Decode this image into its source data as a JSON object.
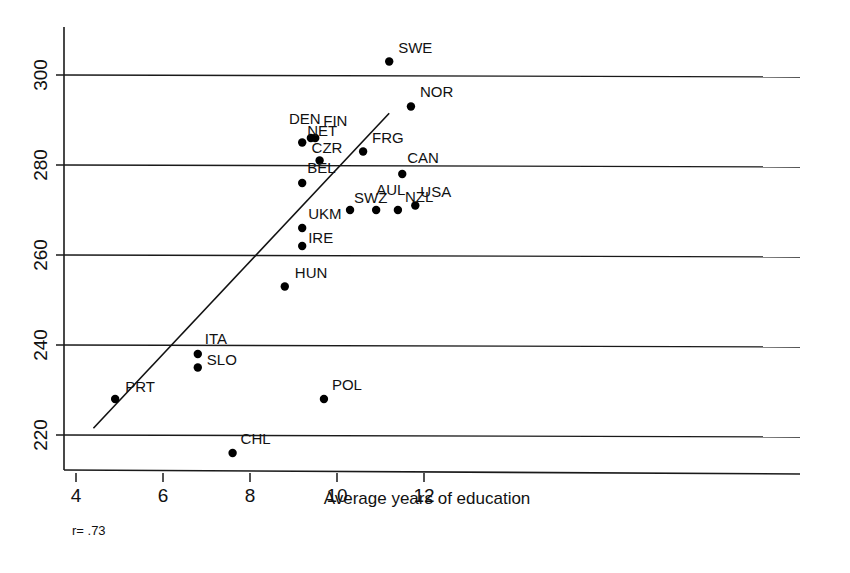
{
  "chart_data": {
    "type": "scatter",
    "title": "",
    "subtitle": "",
    "xlabel": "Average years of education",
    "ylabel": "",
    "xlim": [
      3.5,
      13.0
    ],
    "ylim": [
      212,
      312
    ],
    "xticks": [
      4,
      6,
      8,
      10,
      12
    ],
    "xtick_labels": [
      "4",
      "6",
      "8",
      "10",
      "12"
    ],
    "yticks": [
      220,
      240,
      260,
      280,
      300
    ],
    "ytick_labels": [
      "220",
      "240",
      "260",
      "280",
      "300"
    ],
    "grid": "horizontal",
    "legend": "none",
    "annotations": [
      {
        "name": "correlation",
        "text": "r= .73"
      }
    ],
    "trendline": {
      "type": "linear",
      "x_start": 4.4,
      "y_start": 221.5,
      "x_end": 11.2,
      "y_end": 291.5
    },
    "points": [
      {
        "label": "PRT",
        "x": 4.9,
        "y": 228,
        "label_dx": 10,
        "label_dy": -7
      },
      {
        "label": "CHL",
        "x": 7.6,
        "y": 216,
        "label_dx": 8,
        "label_dy": -9
      },
      {
        "label": "ITA",
        "x": 6.8,
        "y": 238,
        "label_dx": 7,
        "label_dy": -10
      },
      {
        "label": "SLO",
        "x": 6.8,
        "y": 235,
        "label_dx": 9,
        "label_dy": -3
      },
      {
        "label": "HUN",
        "x": 8.8,
        "y": 253,
        "label_dx": 10,
        "label_dy": -9
      },
      {
        "label": "IRE",
        "x": 9.2,
        "y": 262,
        "label_dx": 6,
        "label_dy": -3
      },
      {
        "label": "UKM",
        "x": 9.2,
        "y": 266,
        "label_dx": 6,
        "label_dy": -9
      },
      {
        "label": "BEL",
        "x": 9.2,
        "y": 276,
        "label_dx": 5,
        "label_dy": -10
      },
      {
        "label": "NET",
        "x": 9.2,
        "y": 285,
        "label_dx": 5,
        "label_dy": -7
      },
      {
        "label": "CZR",
        "x": 9.6,
        "y": 281,
        "label_dx": -8,
        "label_dy": -8
      },
      {
        "label": "DEN",
        "x": 9.4,
        "y": 286,
        "label_dx": -22,
        "label_dy": -14
      },
      {
        "label": "FIN",
        "x": 9.5,
        "y": 286,
        "label_dx": 8,
        "label_dy": -12
      },
      {
        "label": "FRG",
        "x": 10.6,
        "y": 283,
        "label_dx": 9,
        "label_dy": -9
      },
      {
        "label": "POL",
        "x": 9.7,
        "y": 228,
        "label_dx": 8,
        "label_dy": -9
      },
      {
        "label": "SWZ",
        "x": 10.3,
        "y": 270,
        "label_dx": 4,
        "label_dy": -7
      },
      {
        "label": "AUL",
        "x": 10.9,
        "y": 270,
        "label_dx": 0,
        "label_dy": -15
      },
      {
        "label": "NZL",
        "x": 11.4,
        "y": 270,
        "label_dx": 7,
        "label_dy": -8
      },
      {
        "label": "USA",
        "x": 11.8,
        "y": 271,
        "label_dx": 5,
        "label_dy": -9
      },
      {
        "label": "CAN",
        "x": 11.5,
        "y": 278,
        "label_dx": 5,
        "label_dy": -11
      },
      {
        "label": "SWE",
        "x": 11.2,
        "y": 303,
        "label_dx": 9,
        "label_dy": -9
      },
      {
        "label": "NOR",
        "x": 11.7,
        "y": 293,
        "label_dx": 9,
        "label_dy": -10
      }
    ]
  }
}
